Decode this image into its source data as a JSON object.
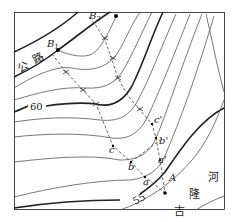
{
  "figure": {
    "type": "topographic contour map",
    "road_label": [
      "公",
      "路"
    ],
    "river_label": [
      "河",
      "隆",
      "吉"
    ],
    "contour_labels": [
      {
        "text": "60",
        "x": 30,
        "y": 92
      },
      {
        "text": "55",
        "x": 129,
        "y": 202
      }
    ],
    "points": [
      {
        "label": "B",
        "sub": "1",
        "x": 52,
        "y": 54
      },
      {
        "label": "B",
        "sub": "2",
        "x": 89,
        "y": 16
      },
      {
        "label": "A",
        "x": 165,
        "y": 173
      },
      {
        "label": "a",
        "x": 145,
        "y": 182
      },
      {
        "label": "a'",
        "x": 160,
        "y": 160
      },
      {
        "label": "b",
        "x": 131,
        "y": 172
      },
      {
        "label": "b'",
        "x": 163,
        "y": 143
      },
      {
        "label": "c",
        "x": 113,
        "y": 150
      },
      {
        "label": "c'",
        "x": 159,
        "y": 122
      }
    ]
  },
  "colors": {
    "line": "#222222",
    "contour": "#555555",
    "background": "#ffffff"
  }
}
